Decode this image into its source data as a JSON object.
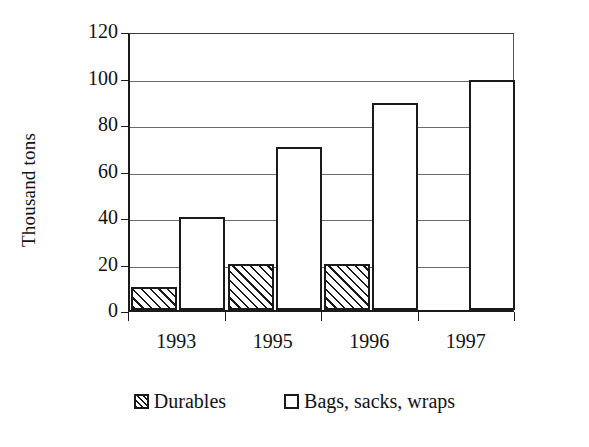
{
  "chart_data": {
    "type": "bar",
    "title": "",
    "xlabel": "",
    "ylabel": "Thousand tons",
    "categories": [
      "1993",
      "1995",
      "1996",
      "1997"
    ],
    "series": [
      {
        "name": "Durables",
        "values": [
          10,
          20,
          20,
          0
        ],
        "fill": "hatched"
      },
      {
        "name": "Bags, sacks, wraps",
        "values": [
          40,
          70,
          89,
          99
        ],
        "fill": "white"
      }
    ],
    "ylim": [
      0,
      120
    ],
    "yticks": [
      0,
      20,
      40,
      60,
      80,
      100,
      120
    ],
    "ytick_labels": [
      "0",
      "20",
      "40",
      "60",
      "80",
      "100",
      "120"
    ],
    "grid": true,
    "grid_axis": "y",
    "legend_position": "bottom",
    "colors": {
      "axis": "#1a1a1a",
      "grid": "#6b6b6b",
      "bar_outline": "#1a1a1a",
      "bar_fill": "#ffffff",
      "background": "#ffffff"
    }
  },
  "legend": {
    "items": [
      {
        "label": "Durables",
        "swatch": "hatched-square-icon"
      },
      {
        "label": "Bags, sacks, wraps",
        "swatch": "white-square-icon"
      }
    ]
  }
}
